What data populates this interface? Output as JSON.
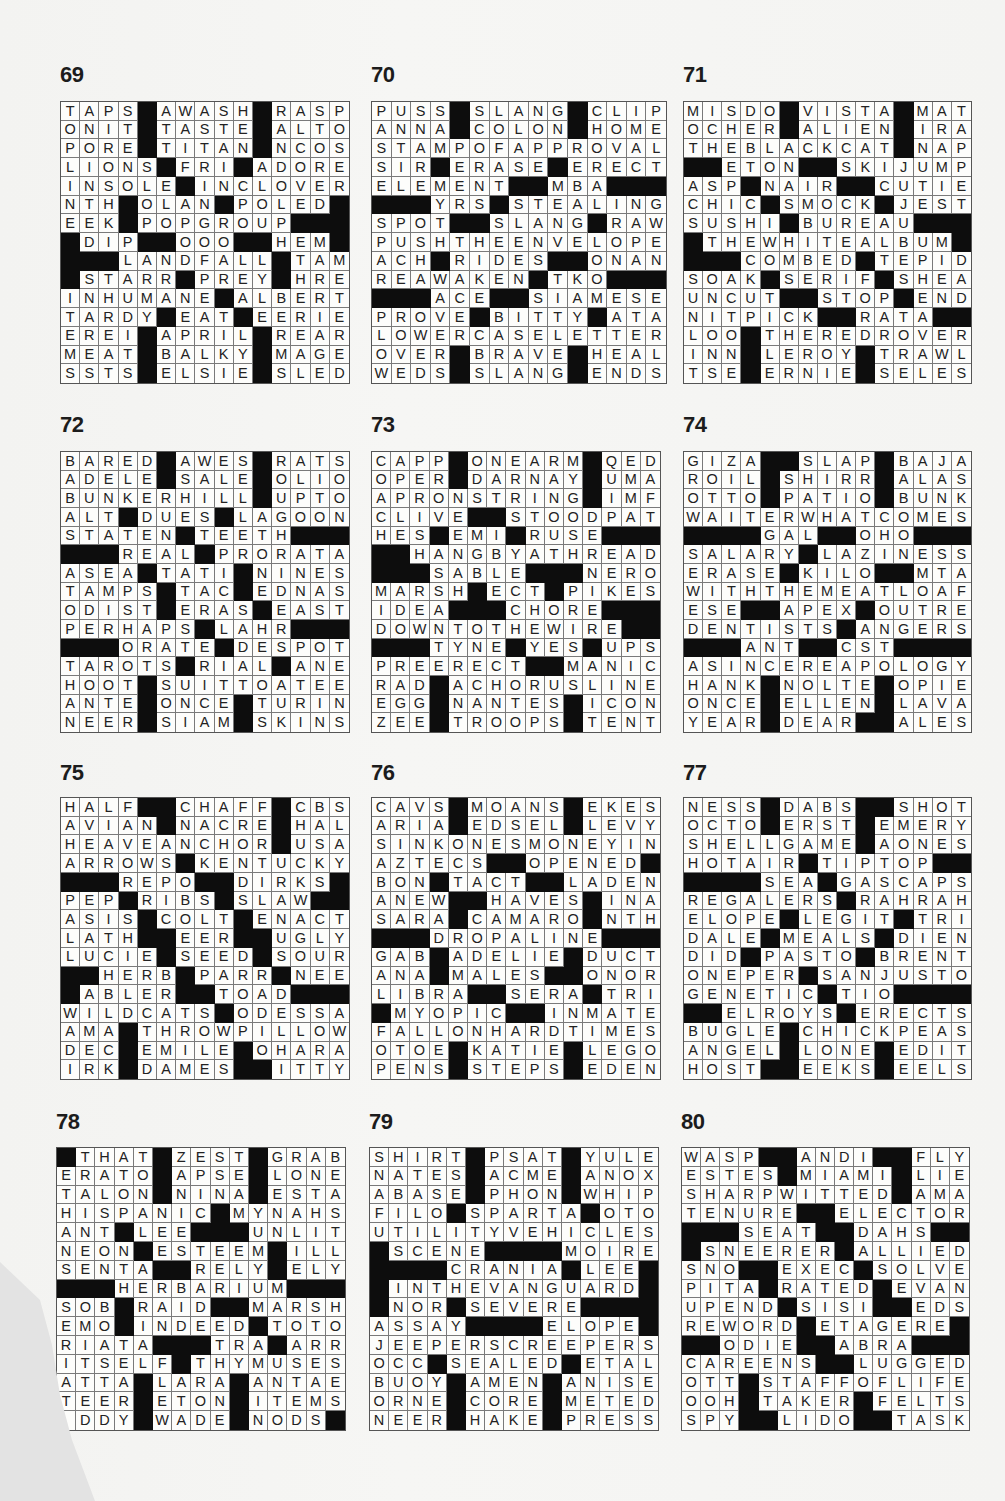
{
  "page": {
    "type": "crossword-solutions",
    "grid_size": 15
  },
  "puzzles": [
    {
      "number": "69",
      "rows": [
        "TAPS#AWASH#RASP",
        "ONIT#TASTE#ALTO",
        "PORE#TITAN#NCOS",
        "LIONS#FRI#ADORE",
        "INSOLE#INCLOVER",
        "NTH#OLAN#POLED#",
        "EEK#POPGROUP###",
        "#DIP##OOO##HEM#",
        "###LANDFALL#TAM",
        "#STARR#PREY#HRE",
        "INHUMANE#ALBERT",
        "TARDY#EAT#EERIE",
        "EREI#APRIL#REAR",
        "MEAT#BALKY#MAGE",
        "SSTS#ELSIE#SLED"
      ]
    },
    {
      "number": "70",
      "rows": [
        "PUSS#SLANG#CLIP",
        "ANNA#COLON#HOME",
        "STAMPOFAPPROVAL",
        "SIR#ERASE#ERECT",
        "ELEMENT##MBA###",
        "###YRS#STEALING",
        "SPOT##SLANG#RAW",
        "PUSHTHEENVELOPE",
        "ACH#RIDES##ONAN",
        "REAWAKEN#TKO###",
        "###ACE##SIAMESE",
        "PROVE#BITTY#ATA",
        "LOWERCASELETTER",
        "OVER#BRAVE#HEAL",
        "WEDS#SLANG#ENDS"
      ]
    },
    {
      "number": "71",
      "rows": [
        "MISDO#VISTA#MAT",
        "OCHER#ALIEN#IRA",
        "THEBLACKCAT#NAP",
        "##ETON##SKIJUMP",
        "ASP#NAIR##CUTIE",
        "CHIC#SMOCK#JEST",
        "SUSHI#BUREAU###",
        "#THEWHITEALBUM#",
        "###COMBED#TEPID",
        "SOAK#SERIF#SHEA",
        "UNCUT##STOP#END",
        "NITPICK##RATA##",
        "LOO#THEREDROVER",
        "INN#LEROY#TRAWL",
        "TSE#ERNIE#SELES"
      ]
    },
    {
      "number": "72",
      "rows": [
        "BARED#AWES#RATS",
        "ADELE#SALE#OLIO",
        "BUNKERHILL#UPTO",
        "ALT#DUES#LAGOON",
        "STATEN#TEETH###",
        "###REAL#PRORATA",
        "ASEA#TATI#NINES",
        "TAMPS#TAC#EDNAS",
        "ODIST#ERAS#EAST",
        "PERHAPS#LAHR###",
        "###ORATE#DESPOT",
        "TAROTS#RIAL#ANE",
        "HOOT#SUITTOATEE",
        "ANTE#ONCE#TURIN",
        "NEER#SIAM#SKINS"
      ]
    },
    {
      "number": "73",
      "rows": [
        "CAPP#ONEARM#QED",
        "OPER#DARNAY#UMA",
        "APRONSTRING#IMF",
        "CLIVE##STOODPAT",
        "HES#EMI#RUSE###",
        "##HANGBYATHREAD",
        "###SABLE###NERO",
        "MARSH#ECT#PIKES",
        "IDEA###CHORE###",
        "DOWNTOTHEWIRE##",
        "###TYNE#YES#UPS",
        "PREERECT##MANIC",
        "RAD#ACHORUSLINE",
        "EGG#NANTES#ICON",
        "ZEE#TROOPS#TENT"
      ]
    },
    {
      "number": "74",
      "rows": [
        "GIZA##SLAP#BAJA",
        "ROIL#SHIRR#ALAS",
        "OTTO#PATIO#BUNK",
        "WAITERWHATCOMES",
        "####GAL##OHO###",
        "SALARY#LAZINESS",
        "ERASE#KILO##MTA",
        "WITHTHEMEATLOAF",
        "ESE##APEX#OUTRE",
        "DENTISTS#ANGERS",
        "###ANT##CST####",
        "ASINCEREAPOLOGY",
        "HANK#NOLTE#OPIE",
        "ONCE#ELLEN#LAVA",
        "YEAR#DEAR##ALES"
      ]
    },
    {
      "number": "75",
      "rows": [
        "HALF##CHAFF#CBS",
        "AVIAN#NACRE#HAL",
        "HEAVEANCHOR#USA",
        "ARROWS#KENTUCKY",
        "###REPO##DIRKS#",
        "PEP#RIBS#SLAW##",
        "ASIS#COLT#ENACT",
        "LATH##EER##UGLY",
        "LUCIE#SEED#SOUR",
        "##HERB#PARR#NEE",
        "#ABLER##TOAD###",
        "WILDCATS#ODESSA",
        "AMA#THROWPILLOW",
        "DEC#EMILE#OHARA",
        "IRK#DAMES##ITTY"
      ]
    },
    {
      "number": "76",
      "rows": [
        "CAVS#MOANS#EKES",
        "ARIA#EDSEL#LEVY",
        "SINKONESMONEYIN",
        "AZTECS##OPENED#",
        "BON#TACT##LADEN",
        "ANEW##HAVES#INA",
        "SARA#CAMARO#NTH",
        "###DROPALINE###",
        "GAB#ADELIE#DUCT",
        "ANA#MALES##ONOR",
        "LIBRA##SERA#TRI",
        "#MYOPIC##INMATE",
        "FALLONHARDTIMES",
        "OTOE#KATIE#LEGO",
        "PENS#STEPS#EDEN"
      ]
    },
    {
      "number": "77",
      "rows": [
        "NESS#DABS##SHOT",
        "OCTO#ERST#EMERY",
        "SHELLGAME#AONES",
        "HOTAIR#TIPTOP##",
        "####SEA#GASCAPS",
        "REGALERS#RAHRAH",
        "ELOPE#LEGIT#TRI",
        "DALE#MEALS#DIEN",
        "DID#PASTO#BRENT",
        "ONEPER#SANJUSTO",
        "GENETIC#TIO####",
        "##ELROYS#ERECTS",
        "BUGLE#CHICKPEAS",
        "ANGEL#LONE#EDIT",
        "HOST##EEKS#EELS"
      ]
    },
    {
      "number": "78",
      "rows": [
        "#THAT#ZEST#GRAB",
        "ERATO#APSE#LONE",
        "TALON#NINA#ESTA",
        "HISPANIC#MYNAHS",
        "ANT#LEE###UNLIT",
        "NEON#ESTEEM#ILL",
        "SENTA##RELY#ELY",
        "###HERBARIUM###",
        "SOB#RAID##MARSH",
        "EMO#INDEED#TOTO",
        "RIATA###TRA#ARR",
        "ITSELF#THYMUSES",
        "ATTA#LARA#ANTAE",
        "TEER#ETON#ITEMS",
        " DDY#WADE#NODS#"
      ]
    },
    {
      "number": "79",
      "rows": [
        "SHIRT#PSAT#YULE",
        "NATES#ACME#ANOX",
        "ABASE#PHON#WHIP",
        "FILO#SPARTA#OTO",
        "UTILITYVEHICLES",
        "#SCENE####MOIRE",
        "####CRANIA#LEE#",
        "#INTHEVANGUARD#",
        "#NOR#SEVERE####",
        "ASSAY####ELOPE#",
        "JEEPERSCREEPERS",
        "OCC#SEALED#ETAL",
        "BUOY#AMEN#ANISE",
        "ORNE#CORE#METED",
        "NEER#HAKE#PRESS"
      ]
    },
    {
      "number": "80",
      "rows": [
        "WASP##ANDI##FLY",
        "ESTES#MIAMI#LIE",
        "SHARPWITTED#AMA",
        "TENURE##ELECTOR",
        "###SEAT##DAHS##",
        "#SNEERER#ALLIED",
        "SNO##EXEC#SOLVE",
        "PITA#RATED#EVAN",
        "UPEND#SISI##EDS",
        "REWORD#ETAGERE#",
        "##ODIE##ABRA###",
        "CAREENS##LUGGED",
        "OTT#STAFFOFLIFE",
        "OOH#TAKER#FELTS",
        "SPY##LIDO##TASK"
      ]
    }
  ]
}
